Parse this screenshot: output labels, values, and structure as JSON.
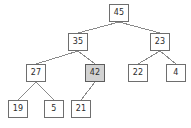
{
  "diagram": {
    "node_fill": "#ffffff",
    "node_fill_highlight": "#d2d2d2",
    "node_stroke": "#6e6e6e",
    "edge_stroke": "#8a8a8a",
    "label_color": "#2b2b2b",
    "nodes": [
      {
        "id": "n45",
        "label": "45",
        "x": 109,
        "y": 4,
        "highlight": false,
        "level": 0
      },
      {
        "id": "n35",
        "label": "35",
        "x": 68,
        "y": 33,
        "highlight": false,
        "level": 1
      },
      {
        "id": "n23",
        "label": "23",
        "x": 150,
        "y": 33,
        "highlight": false,
        "level": 1
      },
      {
        "id": "n27",
        "label": "27",
        "x": 26,
        "y": 64,
        "highlight": false,
        "level": 2
      },
      {
        "id": "n42",
        "label": "42",
        "x": 85,
        "y": 64,
        "highlight": true,
        "level": 2
      },
      {
        "id": "n22",
        "label": "22",
        "x": 128,
        "y": 64,
        "highlight": false,
        "level": 2
      },
      {
        "id": "n4",
        "label": "4",
        "x": 166,
        "y": 64,
        "highlight": false,
        "level": 2
      },
      {
        "id": "n19",
        "label": "19",
        "x": 8,
        "y": 100,
        "highlight": false,
        "level": 3
      },
      {
        "id": "n5",
        "label": "5",
        "x": 44,
        "y": 100,
        "highlight": false,
        "level": 3
      },
      {
        "id": "n21",
        "label": "21",
        "x": 71,
        "y": 100,
        "highlight": false,
        "level": 3
      }
    ],
    "edges": [
      {
        "from": "n45",
        "to": "n35"
      },
      {
        "from": "n45",
        "to": "n23"
      },
      {
        "from": "n35",
        "to": "n27"
      },
      {
        "from": "n35",
        "to": "n42"
      },
      {
        "from": "n23",
        "to": "n22"
      },
      {
        "from": "n23",
        "to": "n4"
      },
      {
        "from": "n27",
        "to": "n19"
      },
      {
        "from": "n27",
        "to": "n5"
      },
      {
        "from": "n42",
        "to": "n21"
      }
    ]
  }
}
